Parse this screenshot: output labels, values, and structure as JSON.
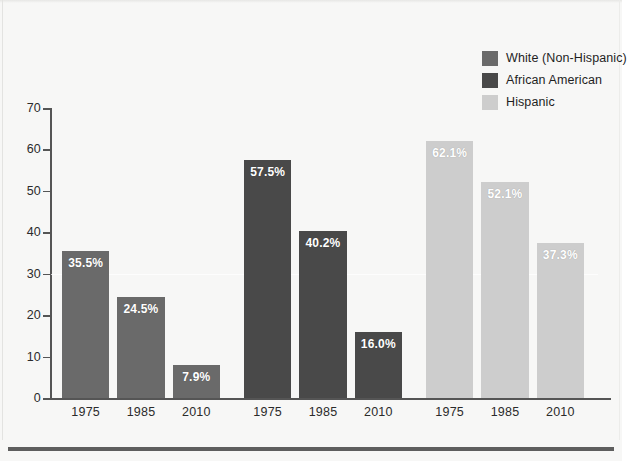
{
  "chart_data": {
    "type": "bar",
    "title": "",
    "subtitle": "",
    "xlabel": "",
    "ylabel": "",
    "ylim": [
      0,
      70
    ],
    "yticks": [
      0,
      10,
      20,
      30,
      40,
      50,
      60,
      70
    ],
    "grid": true,
    "gridlines_at": [
      30
    ],
    "legend_position": "top-right",
    "categories": [
      "1975",
      "1985",
      "2010"
    ],
    "series": [
      {
        "name": "White (Non-Hispanic)",
        "color": "#6a6a6a",
        "values": [
          35.5,
          24.5,
          7.9
        ],
        "labels": [
          "35.5%",
          "24.5%",
          "7.9%"
        ]
      },
      {
        "name": "African American",
        "color": "#494949",
        "values": [
          57.5,
          40.2,
          16.0
        ],
        "labels": [
          "57.5%",
          "40.2%",
          "16.0%"
        ]
      },
      {
        "name": "Hispanic",
        "color": "#cdcdcd",
        "values": [
          62.1,
          52.1,
          37.3
        ],
        "labels": [
          "62.1%",
          "52.1%",
          "37.3%"
        ]
      }
    ]
  },
  "legend": {
    "items": [
      {
        "label": "White (Non-Hispanic)",
        "color": "#6a6a6a"
      },
      {
        "label": "African American",
        "color": "#494949"
      },
      {
        "label": "Hispanic",
        "color": "#cdcdcd"
      }
    ]
  },
  "axes": {
    "y_tick_labels": [
      "0",
      "10",
      "20",
      "30",
      "40",
      "50",
      "60",
      "70"
    ],
    "x_tick_labels": [
      "1975",
      "1985",
      "2010",
      "1975",
      "1985",
      "2010",
      "1975",
      "1985",
      "2010"
    ]
  }
}
